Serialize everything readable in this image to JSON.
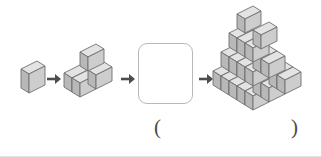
{
  "page": {
    "type": "visual-sequence-puzzle",
    "width": 322,
    "height": 157,
    "background_color": "#ffffff"
  },
  "colors": {
    "cube_top": "#e3e3e3",
    "cube_left": "#b8b8b8",
    "cube_right": "#cdcdcd",
    "cube_outline": "#6f6f6f",
    "arrow": "#4d4d4d",
    "blank_box_border": "#b9b9b9",
    "paren_text": "#4a4a4a"
  },
  "sequence": {
    "label": "cube stack growth sequence",
    "stages": [
      {
        "index": 1,
        "name": "stage-1-single-cube",
        "cube_count": 1,
        "levels": [
          1
        ],
        "description": "one cube"
      },
      {
        "index": 2,
        "name": "stage-2-small-pyramid",
        "cube_count": 4,
        "levels": [
          1,
          3
        ],
        "description": "three cubes on the bottom with one cube on top"
      },
      {
        "index": 3,
        "name": "stage-3-blank-answer-box",
        "cube_count": null,
        "levels": [],
        "description": "empty rounded box to be filled in"
      },
      {
        "index": 4,
        "name": "stage-4-large-pyramid",
        "cube_count": 20,
        "levels": [
          1,
          3,
          6,
          10
        ],
        "description": "four level stepped pyramid"
      }
    ],
    "arrows": [
      {
        "name": "arrow-1",
        "glyph": "→"
      },
      {
        "name": "arrow-2",
        "glyph": "→"
      },
      {
        "name": "arrow-3",
        "glyph": "→"
      }
    ]
  },
  "answer_slot": {
    "open_paren": "(",
    "close_paren": ")",
    "value": ""
  }
}
